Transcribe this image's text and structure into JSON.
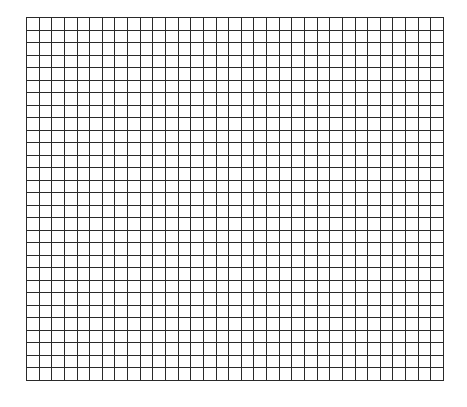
{
  "page": {
    "background_color": "#ffffff",
    "line_color": "#2a2a2a"
  },
  "grid": {
    "columns": 33,
    "rows": 29,
    "left": 26,
    "top": 17,
    "width": 417,
    "height": 363,
    "line_width": 1.2
  }
}
